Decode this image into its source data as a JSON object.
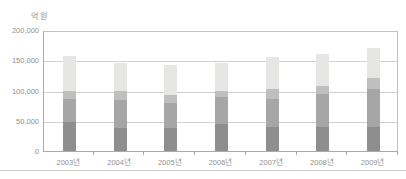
{
  "chart_data": {
    "type": "bar",
    "stacked": true,
    "title": "",
    "ylabel": "억 원",
    "xlabel": "",
    "ylim": [
      0,
      200000
    ],
    "ytick_values": [
      0,
      50000,
      100000,
      150000,
      200000
    ],
    "ytick_labels": [
      "0",
      "50,000",
      "100,000",
      "150,000",
      "200,000"
    ],
    "categories": [
      "2003년",
      "2004년",
      "2005년",
      "2006년",
      "2007년",
      "2008년",
      "2009년"
    ],
    "series": [
      {
        "name": "segment-1-dark-gray",
        "color": "#8e8e8e",
        "values": [
          48000,
          38000,
          38000,
          44000,
          40000,
          39000,
          39000
        ]
      },
      {
        "name": "segment-2-medium-gray",
        "color": "#a6a6a6",
        "values": [
          38000,
          46000,
          42000,
          45000,
          46000,
          55000,
          63000
        ]
      },
      {
        "name": "segment-3-light-gray",
        "color": "#bfbfbf",
        "values": [
          14000,
          16000,
          12000,
          10000,
          16000,
          13000,
          19000
        ]
      },
      {
        "name": "segment-4-lightest-gray",
        "color": "#e6e6e4",
        "values": [
          57000,
          45000,
          50000,
          47000,
          53000,
          53000,
          49000
        ]
      }
    ],
    "totals": [
      157000,
      145000,
      142000,
      146000,
      155000,
      160000,
      170000
    ],
    "legend": "none",
    "grid": true,
    "colors": {
      "background": "#ffffff",
      "gridline": "#d2d2d2",
      "axis": "#a9a9a9",
      "plot_border": "#c2c2c2",
      "tick_text": "#919191",
      "bottom_rule": "#cccccc"
    }
  }
}
